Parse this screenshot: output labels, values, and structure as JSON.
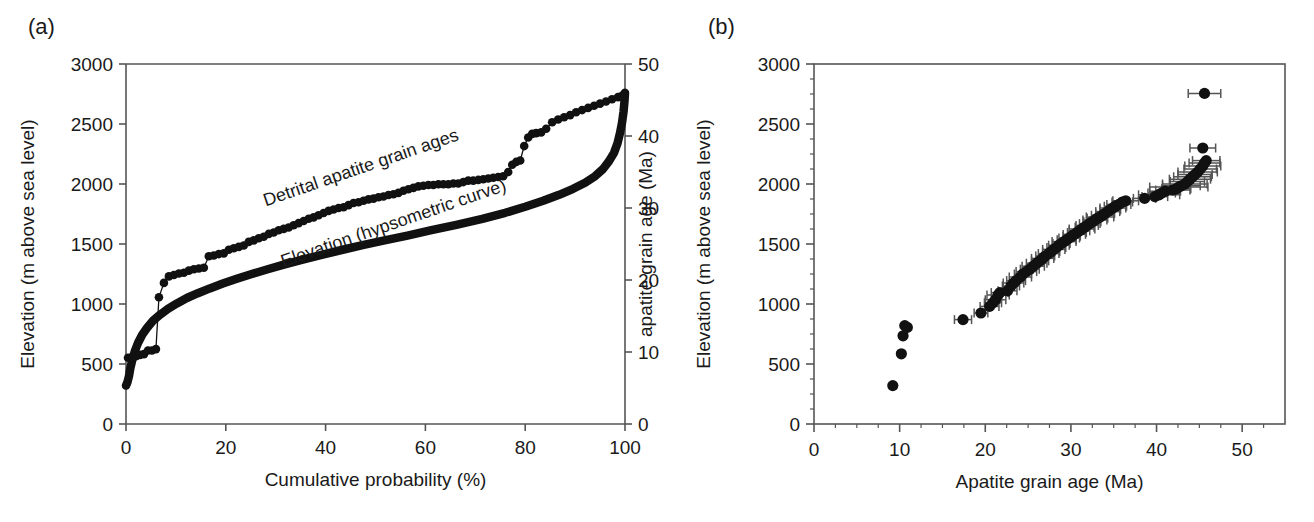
{
  "figure": {
    "background": "#ffffff",
    "ink_color": "#111111",
    "errorbar_color": "#555555"
  },
  "panels": [
    {
      "id": "a",
      "label": "(a)",
      "axes": {
        "x": {
          "title": "Cumulative probability (%)",
          "min": 0,
          "max": 100,
          "ticks": [
            0,
            20,
            40,
            60,
            80,
            100
          ],
          "tick_labels": [
            "0",
            "20",
            "40",
            "60",
            "80",
            "100"
          ]
        },
        "y_left": {
          "title": "Elevation (m above sea level)",
          "min": 0,
          "max": 3000,
          "ticks": [
            0,
            500,
            1000,
            1500,
            2000,
            2500,
            3000
          ],
          "tick_labels": [
            "0",
            "500",
            "1000",
            "1500",
            "2000",
            "2500",
            "3000"
          ]
        },
        "y_right": {
          "title": "apatite grain age (Ma)",
          "min": 0,
          "max": 50,
          "ticks": [
            0,
            10,
            20,
            30,
            40,
            50
          ],
          "tick_labels": [
            "0",
            "10",
            "20",
            "30",
            "40",
            "50"
          ]
        }
      },
      "annotations": [
        {
          "name": "detrital-ages-label",
          "text": "Detrital apatite grain ages",
          "x_pct": 28.0,
          "y_age_ma": 30.2,
          "rotation_deg": -19
        },
        {
          "name": "hypsometric-label",
          "text": "Elevation (hypsometric curve)",
          "x_pct": 31.5,
          "y_elev_m": 1305,
          "rotation_deg": -19
        }
      ]
    },
    {
      "id": "b",
      "label": "(b)",
      "axes": {
        "x": {
          "title": "Apatite grain age (Ma)",
          "min": 0,
          "max": 55,
          "ticks": [
            0,
            10,
            20,
            30,
            40,
            50
          ],
          "tick_labels": [
            "0",
            "10",
            "20",
            "30",
            "40",
            "50"
          ],
          "minor_tick_step": 2.5
        },
        "y": {
          "title": "Elevation (m above sea level)",
          "min": 0,
          "max": 3000,
          "ticks": [
            0,
            500,
            1000,
            1500,
            2000,
            2500,
            3000
          ],
          "tick_labels": [
            "0",
            "500",
            "1000",
            "1500",
            "2000",
            "2500",
            "3000"
          ],
          "minor_tick_step": 125
        }
      }
    }
  ],
  "chart_data": [
    {
      "type": "line",
      "panel": "a",
      "title": "",
      "xlabel": "Cumulative probability (%)",
      "ylabel": "Elevation (m above sea level)",
      "ylabel_right": "apatite grain age (Ma)",
      "xlim": [
        0,
        100
      ],
      "ylim": [
        0,
        3000
      ],
      "ylim_right": [
        0,
        50
      ],
      "grid": false,
      "legend_position": "inline-annotation",
      "series": [
        {
          "name": "Detrital apatite grain ages",
          "marker": "filled-circle",
          "axis": "right",
          "units": "Ma",
          "x": [
            0.4,
            1.2,
            2.0,
            2.8,
            3.6,
            4.4,
            5.2,
            6.0,
            6.6,
            7.6,
            8.6,
            9.6,
            10.6,
            11.6,
            12.6,
            13.6,
            14.6,
            15.6,
            16.6,
            17.6,
            18.6,
            19.6,
            20.6,
            21.6,
            22.6,
            23.6,
            24.6,
            25.6,
            26.6,
            27.6,
            28.6,
            29.6,
            30.6,
            31.6,
            32.6,
            33.6,
            34.6,
            35.6,
            36.6,
            37.6,
            38.6,
            39.6,
            40.6,
            41.6,
            42.6,
            43.6,
            44.6,
            45.6,
            46.6,
            47.6,
            48.6,
            49.6,
            50.6,
            51.6,
            52.6,
            53.6,
            54.6,
            55.6,
            56.6,
            57.6,
            58.6,
            59.6,
            60.6,
            61.6,
            62.6,
            63.6,
            64.6,
            65.6,
            66.6,
            67.6,
            68.6,
            69.6,
            70.6,
            71.6,
            72.6,
            73.6,
            74.6,
            75.6,
            76.6,
            77.4,
            78.2,
            79.0,
            79.8,
            80.6,
            81.4,
            82.2,
            83.2,
            84.2,
            85.4,
            86.6,
            87.8,
            89.0,
            90.2,
            91.4,
            92.6,
            93.8,
            95.0,
            96.2,
            97.4,
            98.6,
            99.4,
            99.9
          ],
          "y": [
            9.2,
            9.3,
            9.4,
            9.6,
            9.7,
            10.2,
            10.2,
            10.4,
            17.6,
            19.6,
            20.5,
            20.7,
            20.9,
            21.0,
            21.3,
            21.5,
            21.6,
            21.7,
            23.3,
            23.4,
            23.6,
            23.7,
            24.2,
            24.4,
            24.6,
            24.8,
            25.3,
            25.5,
            25.8,
            26.0,
            26.4,
            26.6,
            26.9,
            27.1,
            27.3,
            27.6,
            27.9,
            28.2,
            28.5,
            28.7,
            29.0,
            29.3,
            29.6,
            29.8,
            30.0,
            30.1,
            30.4,
            30.7,
            30.8,
            31.0,
            31.2,
            31.3,
            31.5,
            31.6,
            31.8,
            31.9,
            32.1,
            32.4,
            32.6,
            32.8,
            33.0,
            33.1,
            33.2,
            33.2,
            33.3,
            33.3,
            33.3,
            33.4,
            33.4,
            33.6,
            33.8,
            33.8,
            33.9,
            34.0,
            34.1,
            34.2,
            34.3,
            34.4,
            35.0,
            36.0,
            36.4,
            36.6,
            38.6,
            39.8,
            40.3,
            40.4,
            40.5,
            41.0,
            41.9,
            42.3,
            42.6,
            42.9,
            43.3,
            43.6,
            43.9,
            44.2,
            44.5,
            44.8,
            45.1,
            45.4,
            45.6,
            45.8
          ]
        },
        {
          "name": "Elevation (hypsometric curve)",
          "marker": "thick-line",
          "axis": "left",
          "units": "m",
          "x": [
            0.0,
            0.3,
            0.6,
            0.9,
            1.3,
            1.8,
            2.4,
            3.2,
            4.2,
            5.4,
            6.8,
            8.4,
            10.2,
            12.2,
            14.4,
            16.8,
            19.4,
            22.2,
            25.2,
            28.4,
            31.8,
            35.4,
            39.2,
            43.2,
            47.4,
            51.8,
            56.4,
            61.2,
            66.2,
            71.4,
            76.0,
            80.0,
            83.6,
            86.8,
            89.6,
            92.0,
            94.0,
            95.6,
            96.8,
            97.8,
            98.5,
            99.0,
            99.4,
            99.7,
            99.9,
            100.0
          ],
          "y": [
            320,
            350,
            400,
            470,
            540,
            610,
            675,
            740,
            800,
            860,
            910,
            960,
            1005,
            1050,
            1090,
            1130,
            1170,
            1210,
            1250,
            1290,
            1330,
            1370,
            1410,
            1450,
            1490,
            1530,
            1570,
            1615,
            1660,
            1710,
            1760,
            1810,
            1860,
            1910,
            1960,
            2010,
            2065,
            2125,
            2190,
            2260,
            2340,
            2425,
            2510,
            2600,
            2690,
            2760
          ]
        }
      ]
    },
    {
      "type": "scatter",
      "panel": "b",
      "title": "",
      "xlabel": "Apatite grain age (Ma)",
      "ylabel": "Elevation (m above sea level)",
      "xlim": [
        0,
        55
      ],
      "ylim": [
        0,
        3000
      ],
      "grid": false,
      "marker": "filled-circle",
      "error_bars": "horizontal-2sigma",
      "points": [
        {
          "age": 9.2,
          "elev": 320,
          "err": 0.0
        },
        {
          "age": 10.2,
          "elev": 585,
          "err": 0.0
        },
        {
          "age": 10.4,
          "elev": 735,
          "err": 0.0
        },
        {
          "age": 10.6,
          "elev": 820,
          "err": 0.0
        },
        {
          "age": 10.9,
          "elev": 805,
          "err": 0.0
        },
        {
          "age": 17.4,
          "elev": 870,
          "err": 1.0
        },
        {
          "age": 19.5,
          "elev": 925,
          "err": 0.8
        },
        {
          "age": 20.5,
          "elev": 980,
          "err": 1.1
        },
        {
          "age": 20.9,
          "elev": 1010,
          "err": 1.0
        },
        {
          "age": 21.2,
          "elev": 1035,
          "err": 1.2
        },
        {
          "age": 21.5,
          "elev": 1075,
          "err": 1.3
        },
        {
          "age": 21.7,
          "elev": 1095,
          "err": 1.0
        },
        {
          "age": 22.6,
          "elev": 1110,
          "err": 1.1
        },
        {
          "age": 23.0,
          "elev": 1150,
          "err": 1.0
        },
        {
          "age": 23.3,
          "elev": 1175,
          "err": 1.2
        },
        {
          "age": 23.6,
          "elev": 1195,
          "err": 1.1
        },
        {
          "age": 24.1,
          "elev": 1225,
          "err": 1.3
        },
        {
          "age": 24.4,
          "elev": 1250,
          "err": 1.0
        },
        {
          "age": 24.8,
          "elev": 1270,
          "err": 1.2
        },
        {
          "age": 25.2,
          "elev": 1290,
          "err": 1.1
        },
        {
          "age": 25.6,
          "elev": 1315,
          "err": 1.3
        },
        {
          "age": 26.0,
          "elev": 1340,
          "err": 1.2
        },
        {
          "age": 26.4,
          "elev": 1360,
          "err": 1.0
        },
        {
          "age": 26.7,
          "elev": 1380,
          "err": 1.3
        },
        {
          "age": 27.0,
          "elev": 1400,
          "err": 1.1
        },
        {
          "age": 27.4,
          "elev": 1420,
          "err": 1.2
        },
        {
          "age": 27.7,
          "elev": 1435,
          "err": 1.0
        },
        {
          "age": 28.0,
          "elev": 1455,
          "err": 1.3
        },
        {
          "age": 28.3,
          "elev": 1470,
          "err": 1.1
        },
        {
          "age": 28.6,
          "elev": 1490,
          "err": 1.2
        },
        {
          "age": 28.9,
          "elev": 1505,
          "err": 1.0
        },
        {
          "age": 29.2,
          "elev": 1520,
          "err": 1.4
        },
        {
          "age": 29.5,
          "elev": 1535,
          "err": 1.1
        },
        {
          "age": 29.8,
          "elev": 1550,
          "err": 1.2
        },
        {
          "age": 30.1,
          "elev": 1565,
          "err": 1.0
        },
        {
          "age": 30.4,
          "elev": 1580,
          "err": 1.3
        },
        {
          "age": 30.7,
          "elev": 1595,
          "err": 1.1
        },
        {
          "age": 31.0,
          "elev": 1610,
          "err": 1.2
        },
        {
          "age": 31.3,
          "elev": 1625,
          "err": 1.5
        },
        {
          "age": 31.6,
          "elev": 1640,
          "err": 1.1
        },
        {
          "age": 31.9,
          "elev": 1655,
          "err": 1.3
        },
        {
          "age": 32.2,
          "elev": 1670,
          "err": 1.2
        },
        {
          "age": 32.5,
          "elev": 1685,
          "err": 1.0
        },
        {
          "age": 32.8,
          "elev": 1700,
          "err": 1.4
        },
        {
          "age": 33.1,
          "elev": 1715,
          "err": 1.2
        },
        {
          "age": 33.4,
          "elev": 1725,
          "err": 1.6
        },
        {
          "age": 33.7,
          "elev": 1740,
          "err": 1.3
        },
        {
          "age": 34.0,
          "elev": 1755,
          "err": 1.1
        },
        {
          "age": 34.3,
          "elev": 1770,
          "err": 1.4
        },
        {
          "age": 34.6,
          "elev": 1785,
          "err": 1.2
        },
        {
          "age": 34.9,
          "elev": 1800,
          "err": 1.5
        },
        {
          "age": 35.2,
          "elev": 1815,
          "err": 1.3
        },
        {
          "age": 35.6,
          "elev": 1830,
          "err": 1.4
        },
        {
          "age": 36.0,
          "elev": 1850,
          "err": 1.2
        },
        {
          "age": 36.4,
          "elev": 1860,
          "err": 1.5
        },
        {
          "age": 38.6,
          "elev": 1880,
          "err": 1.3
        },
        {
          "age": 39.8,
          "elev": 1895,
          "err": 1.5
        },
        {
          "age": 40.3,
          "elev": 1910,
          "err": 2.4
        },
        {
          "age": 40.6,
          "elev": 1925,
          "err": 1.6
        },
        {
          "age": 41.0,
          "elev": 1940,
          "err": 1.8
        },
        {
          "age": 41.9,
          "elev": 1950,
          "err": 2.0
        },
        {
          "age": 42.3,
          "elev": 1960,
          "err": 1.7
        },
        {
          "age": 42.6,
          "elev": 1975,
          "err": 3.4
        },
        {
          "age": 42.9,
          "elev": 1985,
          "err": 2.2
        },
        {
          "age": 43.3,
          "elev": 2000,
          "err": 2.6
        },
        {
          "age": 43.6,
          "elev": 2020,
          "err": 2.0
        },
        {
          "age": 43.9,
          "elev": 2040,
          "err": 2.4
        },
        {
          "age": 44.2,
          "elev": 2060,
          "err": 2.2
        },
        {
          "age": 44.5,
          "elev": 2080,
          "err": 2.0
        },
        {
          "age": 44.8,
          "elev": 2100,
          "err": 2.3
        },
        {
          "age": 45.1,
          "elev": 2125,
          "err": 1.9
        },
        {
          "age": 45.4,
          "elev": 2150,
          "err": 2.1
        },
        {
          "age": 45.6,
          "elev": 2175,
          "err": 1.8
        },
        {
          "age": 45.8,
          "elev": 2195,
          "err": 1.6
        },
        {
          "age": 45.4,
          "elev": 2300,
          "err": 1.5
        },
        {
          "age": 45.6,
          "elev": 2755,
          "err": 1.9
        }
      ]
    }
  ]
}
